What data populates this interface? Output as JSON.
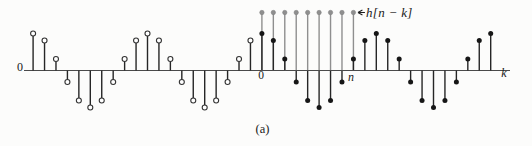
{
  "figure": {
    "caption": "(a)",
    "labels": {
      "origin_left": "0",
      "k_zero": "0",
      "n_marker": "n",
      "k_axis": "k",
      "window_annotation": "h[n − k]"
    },
    "colors": {
      "signal_stem": "#262626",
      "filled_marker": "#161616",
      "open_marker_fill": "#ffffff",
      "open_marker_stroke": "#333333",
      "window_gray": "#8f8f8f",
      "axis": "#4a4a4a",
      "text": "#1a1a1a"
    }
  },
  "chart_data": {
    "type": "stem",
    "xlabel": "k",
    "grid": false,
    "legend": "none",
    "signal": {
      "name": "x[k]",
      "k_min": -20,
      "k_max": 20,
      "period_samples": 10,
      "waveform": "cosine",
      "open_markers_for_k_below": 0,
      "values": [
        1,
        0.809,
        0.309,
        -0.309,
        -0.809,
        -1,
        -0.809,
        -0.309,
        0.309,
        0.809,
        1,
        0.809,
        0.309,
        -0.309,
        -0.809,
        -1,
        -0.809,
        -0.309,
        0.309,
        0.809,
        1,
        0.809,
        0.309,
        -0.309,
        -0.809,
        -1,
        -0.809,
        -0.309,
        0.309,
        0.809,
        1,
        0.809,
        0.309,
        -0.309,
        -0.809,
        -1,
        -0.809,
        -0.309,
        0.309,
        0.809,
        1
      ]
    },
    "window": {
      "name": "h[n−k]",
      "k_from": 0,
      "k_to": 8,
      "n": 8,
      "height_normalized": 1.55
    },
    "layout": {
      "baseline_y_px": 70.5,
      "x_at_k0_px": 261.9,
      "k_step_px": 11.44,
      "amplitude_px": 37,
      "window_top_y_px": 12.5,
      "axis_x_from_px": 24,
      "axis_x_to_px": 510,
      "marker_radius_px": 2.5,
      "window_marker_radius_px": 2.2,
      "stem_width_px": 1.4,
      "axis_width_px": 1.1
    }
  }
}
